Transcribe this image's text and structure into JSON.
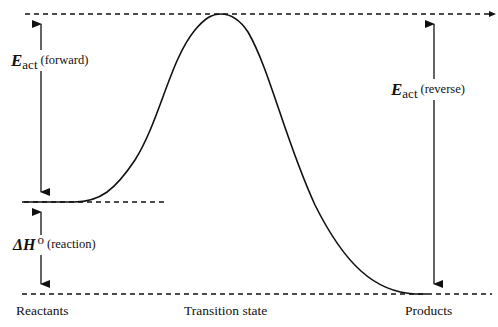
{
  "diagram": {
    "type": "reaction-energy-profile",
    "levels": {
      "transition_state_energy_line": {
        "style": "dashed"
      },
      "reactants_energy_line": {
        "style": "dashed"
      },
      "products_energy_line": {
        "style": "dashed"
      }
    },
    "labels": {
      "eact_forward": {
        "symbol": "E",
        "subscript": "act",
        "qualifier": "(forward)"
      },
      "delta_h": {
        "symbol": "ΔH",
        "superscript": "o",
        "qualifier": "(reaction)"
      },
      "eact_reverse": {
        "symbol": "E",
        "subscript": "act",
        "qualifier": "(reverse)"
      }
    },
    "x_axis_labels": {
      "reactants": "Reactants",
      "transition_state": "Transition state",
      "products": "Products"
    }
  }
}
